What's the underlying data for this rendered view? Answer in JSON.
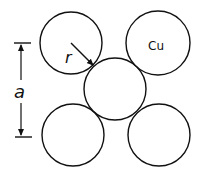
{
  "diagram": {
    "title": "",
    "colors": {
      "line": "#111111",
      "background": "#ffffff"
    },
    "atoms": [
      {
        "id": "top-left",
        "cx": 71,
        "cy": 43,
        "r": 31,
        "label": ""
      },
      {
        "id": "top-right",
        "cx": 158,
        "cy": 43,
        "r": 32,
        "label": "Cu"
      },
      {
        "id": "center",
        "cx": 115,
        "cy": 89,
        "r": 31,
        "label": ""
      },
      {
        "id": "bottom-left",
        "cx": 73,
        "cy": 135,
        "r": 31,
        "label": ""
      },
      {
        "id": "bottom-right",
        "cx": 159,
        "cy": 135,
        "r": 31,
        "label": ""
      }
    ],
    "labels": {
      "element": "Cu",
      "radius": "r",
      "lattice_constant": "a"
    }
  }
}
